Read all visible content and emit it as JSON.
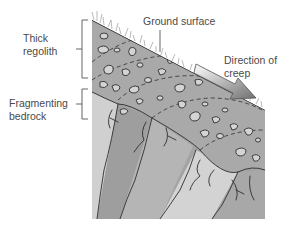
{
  "figure": {
    "labels": {
      "thick_regolith_line1": "Thick",
      "thick_regolith_line2": "regolith",
      "ground_surface": "Ground surface",
      "direction_line1": "Direction of",
      "direction_line2": "creep",
      "fragmenting_line1": "Fragmenting",
      "fragmenting_line2": "bedrock"
    },
    "icons": {
      "creep_arrow": "arrow-down-right-icon",
      "grass": "grass-tufts-icon"
    },
    "colors": {
      "regolith": "#a9a9a9",
      "bedrock_dark": "#9c9c9c",
      "bedrock_light": "#d2d2d2",
      "bedrock_mid": "#b4b4b4",
      "pebble": "#d4d4d4",
      "outline": "#2f2f2f",
      "text": "#4a4a4a"
    }
  }
}
